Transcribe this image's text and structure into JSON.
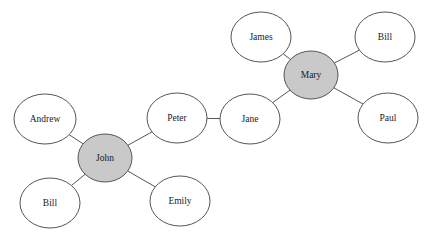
{
  "diagram": {
    "type": "network-graph",
    "title": "",
    "background_color": "#ffffff",
    "edge_color": "#555555",
    "node_border_color": "#555555",
    "hub_fill_color": "#c9c9c9",
    "leaf_fill_color": "#ffffff",
    "label_color": "#1a1a1a",
    "width": 428,
    "height": 240,
    "nodes": [
      {
        "id": "james",
        "label": "James",
        "cx": 261,
        "cy": 37,
        "rx": 30,
        "ry": 25,
        "role": "leaf"
      },
      {
        "id": "bill_tr",
        "label": "Bill",
        "cx": 385,
        "cy": 37,
        "rx": 30,
        "ry": 25,
        "role": "leaf"
      },
      {
        "id": "mary",
        "label": "Mary",
        "cx": 311,
        "cy": 75,
        "rx": 27,
        "ry": 24,
        "role": "hub"
      },
      {
        "id": "paul",
        "label": "Paul",
        "cx": 388,
        "cy": 118,
        "rx": 30,
        "ry": 25,
        "role": "leaf"
      },
      {
        "id": "jane",
        "label": "Jane",
        "cx": 250,
        "cy": 119,
        "rx": 30,
        "ry": 25,
        "role": "leaf"
      },
      {
        "id": "peter",
        "label": "Peter",
        "cx": 177,
        "cy": 118,
        "rx": 30,
        "ry": 25,
        "role": "leaf"
      },
      {
        "id": "andrew",
        "label": "Andrew",
        "cx": 45,
        "cy": 119,
        "rx": 31,
        "ry": 25,
        "role": "leaf"
      },
      {
        "id": "john",
        "label": "John",
        "cx": 105,
        "cy": 158,
        "rx": 27,
        "ry": 24,
        "role": "hub"
      },
      {
        "id": "bill_bl",
        "label": "Bill",
        "cx": 50,
        "cy": 203,
        "rx": 30,
        "ry": 25,
        "role": "leaf"
      },
      {
        "id": "emily",
        "label": "Emily",
        "cx": 180,
        "cy": 201,
        "rx": 30,
        "ry": 25,
        "role": "leaf"
      }
    ],
    "edges": [
      {
        "from": "james",
        "to": "mary"
      },
      {
        "from": "bill_tr",
        "to": "mary"
      },
      {
        "from": "mary",
        "to": "paul"
      },
      {
        "from": "mary",
        "to": "jane"
      },
      {
        "from": "jane",
        "to": "peter"
      },
      {
        "from": "peter",
        "to": "john"
      },
      {
        "from": "andrew",
        "to": "john"
      },
      {
        "from": "john",
        "to": "bill_bl"
      },
      {
        "from": "john",
        "to": "emily"
      }
    ]
  }
}
